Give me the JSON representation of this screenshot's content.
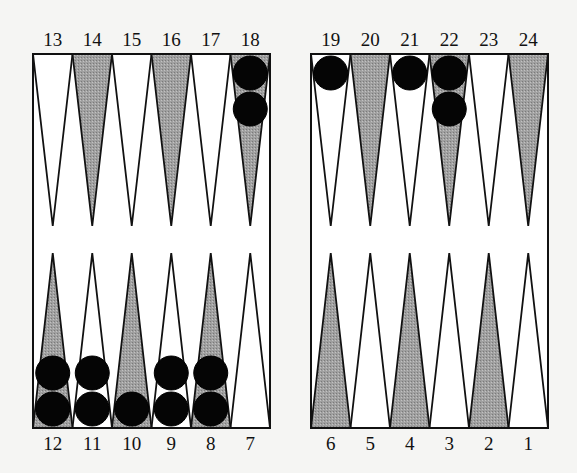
{
  "board": {
    "colors": {
      "background": "#f5f5f3",
      "board_fill": "#ffffff",
      "light_point": "#ffffff",
      "dark_point": "#9a9a9a",
      "outline": "#111111",
      "checker": "#050505"
    },
    "top_labels": [
      "13",
      "14",
      "15",
      "16",
      "17",
      "18",
      "19",
      "20",
      "21",
      "22",
      "23",
      "24"
    ],
    "bottom_labels": [
      "12",
      "11",
      "10",
      "9",
      "8",
      "7",
      "6",
      "5",
      "4",
      "3",
      "2",
      "1"
    ],
    "points": [
      {
        "point": 1,
        "shade": "light",
        "checkers": 0
      },
      {
        "point": 2,
        "shade": "dark",
        "checkers": 0
      },
      {
        "point": 3,
        "shade": "light",
        "checkers": 0
      },
      {
        "point": 4,
        "shade": "dark",
        "checkers": 0
      },
      {
        "point": 5,
        "shade": "light",
        "checkers": 0
      },
      {
        "point": 6,
        "shade": "dark",
        "checkers": 0
      },
      {
        "point": 7,
        "shade": "light",
        "checkers": 0
      },
      {
        "point": 8,
        "shade": "dark",
        "checkers": 2
      },
      {
        "point": 9,
        "shade": "light",
        "checkers": 2
      },
      {
        "point": 10,
        "shade": "dark",
        "checkers": 1
      },
      {
        "point": 11,
        "shade": "light",
        "checkers": 2
      },
      {
        "point": 12,
        "shade": "dark",
        "checkers": 2
      },
      {
        "point": 13,
        "shade": "light",
        "checkers": 0
      },
      {
        "point": 14,
        "shade": "dark",
        "checkers": 0
      },
      {
        "point": 15,
        "shade": "light",
        "checkers": 0
      },
      {
        "point": 16,
        "shade": "dark",
        "checkers": 0
      },
      {
        "point": 17,
        "shade": "light",
        "checkers": 0
      },
      {
        "point": 18,
        "shade": "dark",
        "checkers": 2
      },
      {
        "point": 19,
        "shade": "light",
        "checkers": 1
      },
      {
        "point": 20,
        "shade": "dark",
        "checkers": 0
      },
      {
        "point": 21,
        "shade": "light",
        "checkers": 1
      },
      {
        "point": 22,
        "shade": "dark",
        "checkers": 2
      },
      {
        "point": 23,
        "shade": "light",
        "checkers": 0
      },
      {
        "point": 24,
        "shade": "dark",
        "checkers": 0
      }
    ]
  }
}
